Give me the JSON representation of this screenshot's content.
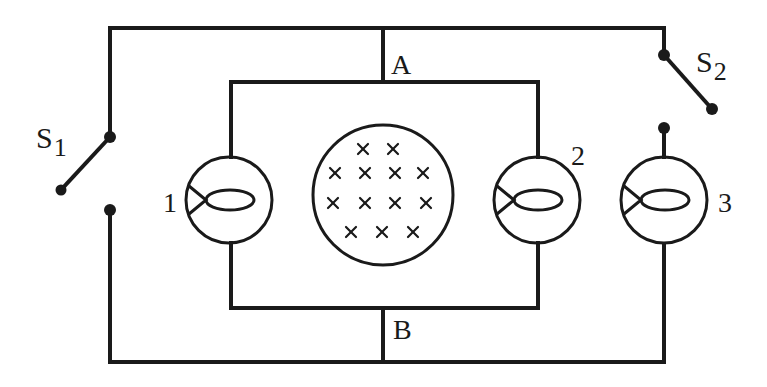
{
  "diagram": {
    "type": "circuit",
    "colors": {
      "line": "#1a1a1a",
      "background": "#ffffff"
    },
    "labels": {
      "switch1_main": "S",
      "switch1_sub": "1",
      "switch2_main": "S",
      "switch2_sub": "2",
      "node_a": "A",
      "node_b": "B",
      "lamp1": "1",
      "lamp2": "2",
      "lamp3": "3"
    },
    "components": [
      {
        "id": "S1",
        "kind": "switch",
        "state": "open"
      },
      {
        "id": "S2",
        "kind": "switch",
        "state": "open"
      },
      {
        "id": "lamp1",
        "kind": "lamp",
        "label": "1"
      },
      {
        "id": "lamp2",
        "kind": "lamp",
        "label": "2"
      },
      {
        "id": "lamp3",
        "kind": "lamp",
        "label": "3"
      },
      {
        "id": "field",
        "kind": "magnetic-field-region",
        "direction": "into-page",
        "symbol": "×",
        "rows": [
          2,
          4,
          4,
          3
        ]
      },
      {
        "id": "A",
        "kind": "node"
      },
      {
        "id": "B",
        "kind": "node"
      }
    ],
    "field_symbol": "×"
  }
}
